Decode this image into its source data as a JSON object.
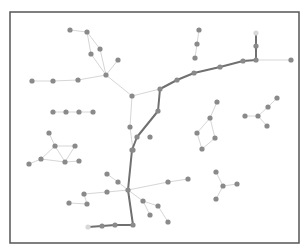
{
  "diagram": {
    "type": "network-graph",
    "frame": {
      "x": 10,
      "y": 12,
      "width": 289,
      "height": 231,
      "stroke": "#555555"
    },
    "colors": {
      "node": "#8a8a8a",
      "node_faint": "#d8d8d8",
      "edge": "#d6d6d6",
      "highlighted_path": "#707070"
    },
    "node_radius": 2.6,
    "nodes": [
      {
        "id": "a1",
        "x": 70,
        "y": 30
      },
      {
        "id": "a2",
        "x": 87,
        "y": 32
      },
      {
        "id": "a3",
        "x": 91,
        "y": 54
      },
      {
        "id": "a4",
        "x": 100,
        "y": 49
      },
      {
        "id": "a5",
        "x": 118,
        "y": 60
      },
      {
        "id": "hub1",
        "x": 106,
        "y": 75
      },
      {
        "id": "a6",
        "x": 78,
        "y": 80
      },
      {
        "id": "a7",
        "x": 53,
        "y": 81
      },
      {
        "id": "a8",
        "x": 32,
        "y": 81
      },
      {
        "id": "hub2",
        "x": 132,
        "y": 96
      },
      {
        "id": "r1",
        "x": 53,
        "y": 112
      },
      {
        "id": "r2",
        "x": 66,
        "y": 112
      },
      {
        "id": "r3",
        "x": 79,
        "y": 112
      },
      {
        "id": "r4",
        "x": 93,
        "y": 112
      },
      {
        "id": "p0",
        "x": 88,
        "y": 227,
        "faint": true
      },
      {
        "id": "p1",
        "x": 102,
        "y": 226
      },
      {
        "id": "p2",
        "x": 115,
        "y": 225
      },
      {
        "id": "p3",
        "x": 133,
        "y": 225
      },
      {
        "id": "p4",
        "x": 128,
        "y": 190
      },
      {
        "id": "p5",
        "x": 132,
        "y": 150
      },
      {
        "id": "p6",
        "x": 137,
        "y": 137
      },
      {
        "id": "p7",
        "x": 158,
        "y": 111
      },
      {
        "id": "p8",
        "x": 160,
        "y": 89
      },
      {
        "id": "p9",
        "x": 177,
        "y": 80
      },
      {
        "id": "p10",
        "x": 194,
        "y": 73
      },
      {
        "id": "p11",
        "x": 220,
        "y": 67
      },
      {
        "id": "p12",
        "x": 243,
        "y": 61
      },
      {
        "id": "p13",
        "x": 256,
        "y": 60
      },
      {
        "id": "p14",
        "x": 256,
        "y": 46
      },
      {
        "id": "p15",
        "x": 256,
        "y": 33,
        "faint": true
      },
      {
        "id": "b1",
        "x": 291,
        "y": 60
      },
      {
        "id": "c1",
        "x": 199,
        "y": 30
      },
      {
        "id": "c2",
        "x": 197,
        "y": 44
      },
      {
        "id": "c3",
        "x": 195,
        "y": 58
      },
      {
        "id": "d1",
        "x": 130,
        "y": 127
      },
      {
        "id": "d2",
        "x": 150,
        "y": 137
      },
      {
        "id": "d3",
        "x": 133,
        "y": 150
      },
      {
        "id": "e1",
        "x": 217,
        "y": 102
      },
      {
        "id": "e2",
        "x": 210,
        "y": 118
      },
      {
        "id": "e3",
        "x": 197,
        "y": 133
      },
      {
        "id": "e4",
        "x": 215,
        "y": 138
      },
      {
        "id": "e5",
        "x": 202,
        "y": 149
      },
      {
        "id": "f1",
        "x": 277,
        "y": 98
      },
      {
        "id": "f2",
        "x": 268,
        "y": 107
      },
      {
        "id": "f3",
        "x": 245,
        "y": 116
      },
      {
        "id": "f4",
        "x": 258,
        "y": 116
      },
      {
        "id": "f5",
        "x": 267,
        "y": 126
      },
      {
        "id": "g1",
        "x": 49,
        "y": 133
      },
      {
        "id": "g2",
        "x": 55,
        "y": 146
      },
      {
        "id": "g3",
        "x": 75,
        "y": 146
      },
      {
        "id": "g4",
        "x": 41,
        "y": 159
      },
      {
        "id": "g5",
        "x": 65,
        "y": 162
      },
      {
        "id": "g6",
        "x": 79,
        "y": 161
      },
      {
        "id": "g7",
        "x": 29,
        "y": 164
      },
      {
        "id": "h1",
        "x": 107,
        "y": 174
      },
      {
        "id": "h2",
        "x": 118,
        "y": 182
      },
      {
        "id": "h3",
        "x": 84,
        "y": 194
      },
      {
        "id": "h4",
        "x": 107,
        "y": 192
      },
      {
        "id": "h5",
        "x": 87,
        "y": 204
      },
      {
        "id": "h6",
        "x": 69,
        "y": 203
      },
      {
        "id": "i1",
        "x": 168,
        "y": 182
      },
      {
        "id": "i2",
        "x": 188,
        "y": 179
      },
      {
        "id": "i3",
        "x": 143,
        "y": 201
      },
      {
        "id": "i4",
        "x": 158,
        "y": 206
      },
      {
        "id": "i5",
        "x": 150,
        "y": 215
      },
      {
        "id": "i6",
        "x": 168,
        "y": 222
      },
      {
        "id": "j1",
        "x": 216,
        "y": 172
      },
      {
        "id": "j2",
        "x": 223,
        "y": 186
      },
      {
        "id": "j3",
        "x": 237,
        "y": 184
      },
      {
        "id": "j4",
        "x": 216,
        "y": 199
      }
    ],
    "edges": [
      [
        "a1",
        "a2"
      ],
      [
        "a2",
        "a3"
      ],
      [
        "a2",
        "a4"
      ],
      [
        "a3",
        "hub1"
      ],
      [
        "a4",
        "hub1"
      ],
      [
        "a5",
        "hub1"
      ],
      [
        "hub1",
        "a6"
      ],
      [
        "a6",
        "a7"
      ],
      [
        "a7",
        "a8"
      ],
      [
        "hub1",
        "hub2"
      ],
      [
        "hub2",
        "p8"
      ],
      [
        "hub2",
        "d1"
      ],
      [
        "d1",
        "d3"
      ],
      [
        "r1",
        "r2"
      ],
      [
        "r2",
        "r3"
      ],
      [
        "r3",
        "r4"
      ],
      [
        "p13",
        "b1"
      ],
      [
        "c1",
        "c2"
      ],
      [
        "c2",
        "c3"
      ],
      [
        "e1",
        "e2"
      ],
      [
        "e2",
        "e3"
      ],
      [
        "e2",
        "e4"
      ],
      [
        "e3",
        "e5"
      ],
      [
        "e4",
        "e5"
      ],
      [
        "f1",
        "f2"
      ],
      [
        "f2",
        "f4"
      ],
      [
        "f3",
        "f4"
      ],
      [
        "f4",
        "f5"
      ],
      [
        "g1",
        "g2"
      ],
      [
        "g2",
        "g3"
      ],
      [
        "g2",
        "g4"
      ],
      [
        "g2",
        "g5"
      ],
      [
        "g3",
        "g5"
      ],
      [
        "g5",
        "g6"
      ],
      [
        "g4",
        "g5"
      ],
      [
        "g4",
        "g7"
      ],
      [
        "h1",
        "h2"
      ],
      [
        "h2",
        "p4"
      ],
      [
        "h4",
        "p4"
      ],
      [
        "h3",
        "h4"
      ],
      [
        "h3",
        "h5"
      ],
      [
        "h5",
        "h6"
      ],
      [
        "p4",
        "i1"
      ],
      [
        "i1",
        "i2"
      ],
      [
        "p4",
        "i3"
      ],
      [
        "i3",
        "i4"
      ],
      [
        "i3",
        "i5"
      ],
      [
        "i4",
        "i6"
      ],
      [
        "j1",
        "j2"
      ],
      [
        "j2",
        "j3"
      ],
      [
        "j2",
        "j4"
      ]
    ],
    "highlighted_path": [
      "p0",
      "p1",
      "p2",
      "p3",
      "p4",
      "p5",
      "p6",
      "p7",
      "p8",
      "p9",
      "p10",
      "p11",
      "p12",
      "p13",
      "p14",
      "p15"
    ]
  }
}
